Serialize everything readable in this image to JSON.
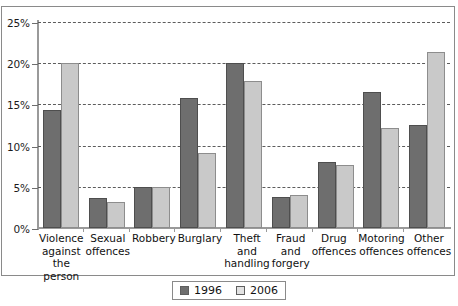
{
  "chart_data": {
    "type": "bar",
    "title": "",
    "xlabel": "",
    "ylabel": "",
    "ylim": [
      0,
      25
    ],
    "ytick_values": [
      0,
      5,
      10,
      15,
      20,
      25
    ],
    "ytick_labels": [
      "0%",
      "5%",
      "10%",
      "15%",
      "20%",
      "25%"
    ],
    "grid": true,
    "grid_axis": "y",
    "legend_position": "bottom-center",
    "categories": [
      "Violence against the person",
      "Sexual offences",
      "Robbery",
      "Burglary",
      "Theft and handling",
      "Fraud and forgery",
      "Drug offences",
      "Motoring offences",
      "Other offences"
    ],
    "category_lines": [
      [
        "Violence",
        "against the",
        "person"
      ],
      [
        "Sexual",
        "offences"
      ],
      [
        "Robbery"
      ],
      [
        "Burglary"
      ],
      [
        "Theft and",
        "handling"
      ],
      [
        "Fraud and",
        "forgery"
      ],
      [
        "Drug",
        "offences"
      ],
      [
        "Motoring",
        "offences"
      ],
      [
        "Other",
        "offences"
      ]
    ],
    "series": [
      {
        "name": "1996",
        "color": "#6e6e6e",
        "values": [
          14.3,
          3.6,
          5.0,
          15.8,
          20.0,
          3.8,
          8.0,
          16.5,
          12.5
        ]
      },
      {
        "name": "2006",
        "color": "#c9c9c9",
        "values": [
          20.0,
          3.1,
          5.0,
          9.1,
          17.8,
          4.0,
          7.6,
          12.1,
          21.4
        ]
      }
    ]
  },
  "legend": {
    "items": [
      {
        "label": "1996"
      },
      {
        "label": "2006"
      }
    ]
  }
}
